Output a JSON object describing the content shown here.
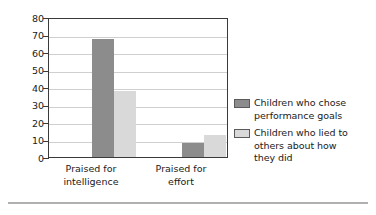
{
  "chart_data": {
    "type": "bar",
    "title": "",
    "xlabel": "",
    "ylabel": "Percentage of children",
    "ylim": [
      0,
      80
    ],
    "yticks": [
      0,
      10,
      20,
      30,
      40,
      50,
      60,
      70,
      80
    ],
    "ytick_labels": [
      "0",
      "10",
      "20",
      "30",
      "40",
      "50",
      "60",
      "70",
      "80"
    ],
    "grid": true,
    "legend_position": "right",
    "categories": [
      "Praised for intelligence",
      "Praised for effort"
    ],
    "category_lines": [
      [
        "Praised for",
        "intelligence"
      ],
      [
        "Praised for",
        "effort"
      ]
    ],
    "series": [
      {
        "name": "Children who chose performance goals",
        "name_lines": [
          "Children who chose",
          "performance goals"
        ],
        "color": "#8c8c8c",
        "values": [
          67.5,
          8
        ]
      },
      {
        "name": "Children who lied to others about how they did",
        "name_lines": [
          "Children who lied to",
          "others about how",
          "they did"
        ],
        "color": "#d9d9d9",
        "values": [
          38,
          12.5
        ]
      }
    ]
  },
  "colors": {
    "dark_series": "#8c8c8c",
    "light_series": "#d9d9d9",
    "axis": "#3a3a3a",
    "gridline": "#cfcfcf",
    "text": "#1a1a1a",
    "rule": "#b0b0b0"
  }
}
